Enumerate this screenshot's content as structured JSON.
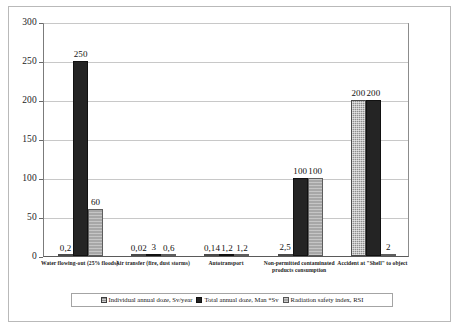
{
  "chart_data": {
    "type": "bar",
    "title": "",
    "xlabel": "",
    "ylabel": "",
    "ylim": [
      0,
      300
    ],
    "yticks": [
      "0",
      "50",
      "100",
      "150",
      "200",
      "250",
      "300"
    ],
    "grid": true,
    "legend_position": "bottom",
    "categories": [
      "Water flowing-out (25% floods)",
      "Air transfer (fire, dust storms)",
      "Autotransport",
      "Non-permitted contaminated products consumption",
      "Accident at \"Shell\" to object"
    ],
    "series": [
      {
        "name": "Individual annual doze, Sv/year",
        "color": "#8f8f8f",
        "values": [
          0.2,
          0.02,
          0.14,
          2.5,
          200
        ],
        "labels": [
          "0,2",
          "0,02",
          "0,14",
          "2,5",
          "200"
        ]
      },
      {
        "name": "Total annual doze, Man *Sv",
        "color": "#242424",
        "values": [
          250,
          3,
          1.2,
          100,
          200
        ],
        "labels": [
          "250",
          "3",
          "1,2",
          "100",
          "200"
        ]
      },
      {
        "name": "Radiation safety index, RSI",
        "color": "#a7a7a7",
        "values": [
          60,
          0.6,
          1.2,
          100,
          2
        ],
        "labels": [
          "60",
          "0,6",
          "1,2",
          "100",
          "2"
        ]
      }
    ]
  },
  "legend": {
    "items": [
      "Individual annual doze, Sv/year",
      "Total annual doze, Man *Sv",
      "Radiation safety index, RSI"
    ]
  }
}
